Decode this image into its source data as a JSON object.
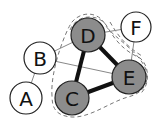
{
  "diagram": {
    "type": "graph",
    "nodes": [
      {
        "id": "A",
        "label": "A",
        "x": 26,
        "y": 98,
        "r": 16,
        "fill": "#ffffff"
      },
      {
        "id": "B",
        "label": "B",
        "x": 40,
        "y": 58,
        "r": 16,
        "fill": "#ffffff"
      },
      {
        "id": "C",
        "label": "C",
        "x": 72,
        "y": 98,
        "r": 17,
        "fill": "#8c8c8c"
      },
      {
        "id": "D",
        "label": "D",
        "x": 88,
        "y": 35,
        "r": 17,
        "fill": "#8c8c8c"
      },
      {
        "id": "E",
        "label": "E",
        "x": 129,
        "y": 77,
        "r": 17,
        "fill": "#8c8c8c"
      },
      {
        "id": "F",
        "label": "F",
        "x": 136,
        "y": 27,
        "r": 15,
        "fill": "#ffffff"
      }
    ],
    "edges": [
      {
        "from": "A",
        "to": "B",
        "weight": "thin"
      },
      {
        "from": "B",
        "to": "D",
        "weight": "thin"
      },
      {
        "from": "B",
        "to": "E",
        "weight": "thin"
      },
      {
        "from": "D",
        "to": "F",
        "weight": "thin"
      },
      {
        "from": "F",
        "to": "E",
        "weight": "thin"
      },
      {
        "from": "D",
        "to": "C",
        "weight": "thick"
      },
      {
        "from": "D",
        "to": "E",
        "weight": "thick"
      },
      {
        "from": "C",
        "to": "E",
        "weight": "thick"
      }
    ],
    "groups": [
      {
        "name": "clique-CDE",
        "members": [
          "C",
          "D",
          "E"
        ],
        "style": "dashed"
      },
      {
        "name": "group-DEF",
        "members": [
          "D",
          "E",
          "F"
        ],
        "style": "dashed"
      }
    ]
  }
}
